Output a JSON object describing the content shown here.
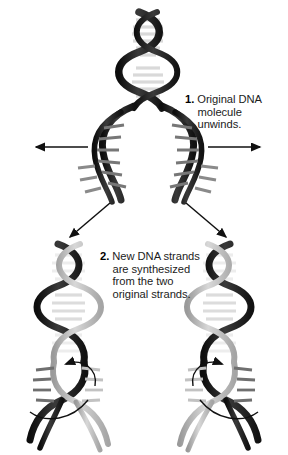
{
  "figure": {
    "name": "dna-replication-diagram",
    "background_color": "#ffffff",
    "top_caption": "by the body's cells as they are needed.",
    "steps": [
      {
        "number": "1.",
        "line1": "Original DNA",
        "line2": "molecule unwinds.",
        "line3": "",
        "line4": ""
      },
      {
        "number": "2.",
        "line1": "New DNA strands",
        "line2": "are synthesized",
        "line3": "from the two",
        "line4": "original strands."
      }
    ]
  },
  "colors": {
    "original_strand": "#2b2b2b",
    "original_strand_dark": "#161616",
    "new_strand": "#b0b0b0",
    "new_strand_light": "#d2d2d2",
    "rung_light": "#e8e8e8",
    "rung_dark": "#4a4a4a",
    "arrow": "#111111",
    "text": "#1c1c1c"
  },
  "annotations": {
    "unwind_arrow_left": "unwinding direction left",
    "unwind_arrow_right": "unwinding direction right",
    "branch_arrow_left": "leads to left daughter molecule",
    "branch_arrow_right": "leads to right daughter molecule",
    "synthesis_arrow_left": "synthesis direction at left replication fork",
    "synthesis_arrow_right": "synthesis direction at right replication fork"
  }
}
